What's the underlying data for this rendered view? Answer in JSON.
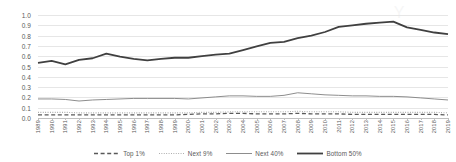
{
  "chart_data": {
    "type": "line",
    "title": "",
    "subtitle": "",
    "xlabel": "",
    "ylabel": "",
    "ylim": [
      0.0,
      1.0
    ],
    "yticks": [
      "0.0",
      "0.1",
      "0.2",
      "0.3",
      "0.4",
      "0.5",
      "0.6",
      "0.7",
      "0.8",
      "0.9",
      "1.0"
    ],
    "ytick_values": [
      0.0,
      0.1,
      0.2,
      0.3,
      0.4,
      0.5,
      0.6,
      0.7,
      0.8,
      0.9,
      1.0
    ],
    "grid": true,
    "legend_position": "bottom",
    "categories": [
      "1989",
      "1990",
      "1991",
      "1992",
      "1993",
      "1994",
      "1995",
      "1996",
      "1997",
      "1998",
      "1999",
      "2000",
      "2001",
      "2002",
      "2003",
      "2004",
      "2005",
      "2006",
      "2007",
      "2008",
      "2009",
      "2010",
      "2011",
      "2012",
      "2013",
      "2014",
      "2015",
      "2016",
      "2017",
      "2018",
      "2019"
    ],
    "x": [
      1989,
      1990,
      1991,
      1992,
      1993,
      1994,
      1995,
      1996,
      1997,
      1998,
      1999,
      2000,
      2001,
      2002,
      2003,
      2004,
      2005,
      2006,
      2007,
      2008,
      2009,
      2010,
      2011,
      2012,
      2013,
      2014,
      2015,
      2016,
      2017,
      2018,
      2019
    ],
    "series": [
      {
        "name": "Top 1%",
        "style": "dashed",
        "color": "#595959",
        "values": [
          0.03,
          0.03,
          0.03,
          0.03,
          0.03,
          0.03,
          0.03,
          0.03,
          0.03,
          0.03,
          0.03,
          0.035,
          0.04,
          0.04,
          0.045,
          0.045,
          0.04,
          0.04,
          0.04,
          0.045,
          0.04,
          0.04,
          0.04,
          0.035,
          0.035,
          0.035,
          0.035,
          0.035,
          0.035,
          0.035,
          0.03
        ]
      },
      {
        "name": "Next 9%",
        "style": "dotted",
        "color": "#a6a6a6",
        "values": [
          0.055,
          0.055,
          0.055,
          0.05,
          0.05,
          0.05,
          0.05,
          0.05,
          0.05,
          0.05,
          0.05,
          0.05,
          0.055,
          0.055,
          0.06,
          0.06,
          0.06,
          0.06,
          0.06,
          0.065,
          0.06,
          0.06,
          0.06,
          0.055,
          0.055,
          0.055,
          0.055,
          0.055,
          0.055,
          0.055,
          0.05
        ]
      },
      {
        "name": "Next 40%",
        "style": "solid-thin",
        "color": "#808080",
        "values": [
          0.185,
          0.185,
          0.18,
          0.165,
          0.175,
          0.18,
          0.185,
          0.19,
          0.19,
          0.19,
          0.19,
          0.185,
          0.195,
          0.205,
          0.215,
          0.215,
          0.21,
          0.21,
          0.22,
          0.245,
          0.235,
          0.225,
          0.22,
          0.215,
          0.215,
          0.21,
          0.21,
          0.205,
          0.195,
          0.185,
          0.175
        ]
      },
      {
        "name": "Bottom 50%",
        "style": "solid-thick",
        "color": "#404040",
        "values": [
          0.535,
          0.555,
          0.52,
          0.565,
          0.58,
          0.625,
          0.595,
          0.575,
          0.56,
          0.575,
          0.585,
          0.585,
          0.6,
          0.615,
          0.625,
          0.66,
          0.695,
          0.73,
          0.74,
          0.775,
          0.8,
          0.835,
          0.885,
          0.9,
          0.915,
          0.925,
          0.935,
          0.88,
          0.855,
          0.83,
          0.815
        ]
      }
    ]
  },
  "legend": {
    "items": [
      {
        "label": "Top 1%"
      },
      {
        "label": "Next 9%"
      },
      {
        "label": "Next 40%"
      },
      {
        "label": "Bottom 50%"
      }
    ]
  }
}
